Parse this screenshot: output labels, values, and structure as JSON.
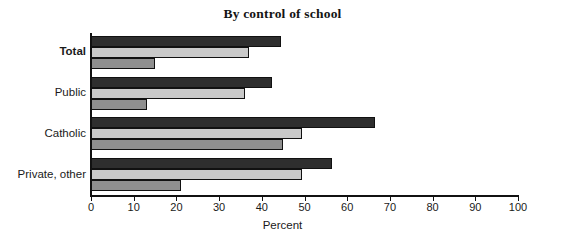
{
  "chart_data": {
    "type": "bar",
    "orientation": "horizontal",
    "title": "By control of school",
    "xlabel": "Percent",
    "ylabel": "",
    "xlim": [
      0,
      100
    ],
    "xticks": [
      0,
      10,
      20,
      30,
      40,
      50,
      60,
      70,
      80,
      90,
      100
    ],
    "xtick_labels": [
      "0",
      "10",
      "20",
      "30",
      "40",
      "50",
      "60",
      "70",
      "80",
      "90",
      "100"
    ],
    "grid": false,
    "legend": "none",
    "categories": [
      "Total",
      "Public",
      "Catholic",
      "Private, other"
    ],
    "emphasized_category": "Total",
    "series": [
      {
        "name": "series-1",
        "color": "#2e2e2e",
        "values": [
          44.5,
          42.5,
          66.5,
          56.5
        ]
      },
      {
        "name": "series-2",
        "color": "#c9c9c9",
        "values": [
          37.0,
          36.0,
          49.5,
          49.5
        ]
      },
      {
        "name": "series-3",
        "color": "#8f8f8f",
        "values": [
          15.0,
          13.0,
          45.0,
          21.0
        ]
      }
    ]
  }
}
